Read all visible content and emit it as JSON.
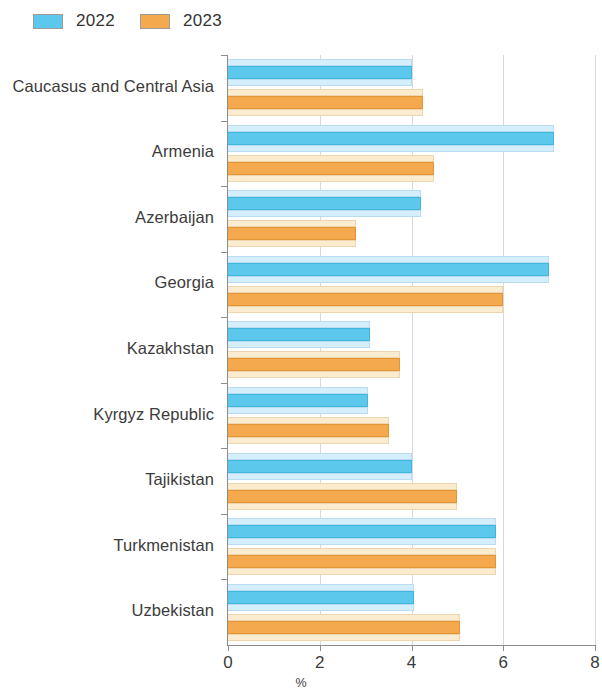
{
  "legend": {
    "position": "top-left",
    "entries": [
      {
        "label": "2022",
        "color": "#5bc8ec"
      },
      {
        "label": "2023",
        "color": "#f5a94e"
      }
    ]
  },
  "axis": {
    "x_title": "%",
    "ticks": [
      "0",
      "2",
      "4",
      "6",
      "8"
    ]
  },
  "chart_data": {
    "type": "bar",
    "orientation": "horizontal",
    "title": "",
    "xlabel": "%",
    "ylabel": "",
    "xlim": [
      0,
      8
    ],
    "xticks": [
      0,
      2,
      4,
      6,
      8
    ],
    "grid": true,
    "legend_position": "top-left",
    "categories": [
      "Caucasus and Central Asia",
      "Armenia",
      "Azerbaijan",
      "Georgia",
      "Kazakhstan",
      "Kyrgyz Republic",
      "Tajikistan",
      "Turkmenistan",
      "Uzbekistan"
    ],
    "series": [
      {
        "name": "2022",
        "color": "#5bc8ec",
        "values": [
          4.0,
          7.1,
          4.2,
          7.0,
          3.1,
          3.05,
          4.0,
          5.85,
          4.05
        ]
      },
      {
        "name": "2023",
        "color": "#f5a94e",
        "values": [
          4.25,
          4.5,
          2.8,
          6.0,
          3.75,
          3.5,
          5.0,
          5.85,
          5.05
        ]
      }
    ]
  }
}
